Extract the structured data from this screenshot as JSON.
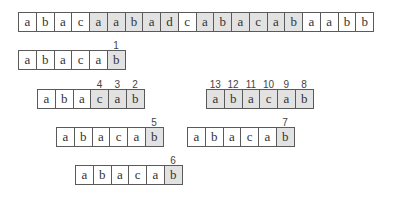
{
  "text": {
    "chars": [
      "a",
      "b",
      "a",
      "c",
      "a",
      "a",
      "b",
      "a",
      "d",
      "c",
      "a",
      "b",
      "a",
      "c",
      "a",
      "b",
      "a",
      "a",
      "b",
      "b"
    ],
    "shaded": [
      false,
      false,
      false,
      false,
      true,
      true,
      true,
      true,
      true,
      false,
      true,
      true,
      true,
      true,
      true,
      true,
      false,
      false,
      false,
      false
    ]
  },
  "pattern_rows": [
    {
      "id": "row1",
      "x": 18,
      "y": 50,
      "chars": [
        "a",
        "b",
        "a",
        "c",
        "a",
        "b"
      ],
      "shaded": [
        false,
        false,
        false,
        false,
        false,
        true
      ],
      "labels": [
        "",
        "",
        "",
        "",
        "",
        "1"
      ]
    },
    {
      "id": "row2-left",
      "x": 37,
      "y": 89,
      "chars": [
        "a",
        "b",
        "a",
        "c",
        "a",
        "b"
      ],
      "shaded": [
        false,
        false,
        false,
        true,
        true,
        true
      ],
      "labels": [
        "",
        "",
        "",
        "4",
        "3",
        "2"
      ]
    },
    {
      "id": "row2-right",
      "x": 206,
      "y": 89,
      "chars": [
        "a",
        "b",
        "a",
        "c",
        "a",
        "b"
      ],
      "shaded": [
        true,
        true,
        true,
        true,
        true,
        true
      ],
      "labels": [
        "13",
        "12",
        "11",
        "10",
        "9",
        "8"
      ]
    },
    {
      "id": "row3-left",
      "x": 56,
      "y": 127,
      "chars": [
        "a",
        "b",
        "a",
        "c",
        "a",
        "b"
      ],
      "shaded": [
        false,
        false,
        false,
        false,
        false,
        true
      ],
      "labels": [
        "",
        "",
        "",
        "",
        "",
        "5"
      ]
    },
    {
      "id": "row3-right",
      "x": 187,
      "y": 127,
      "chars": [
        "a",
        "b",
        "a",
        "c",
        "a",
        "b"
      ],
      "shaded": [
        false,
        false,
        false,
        false,
        false,
        true
      ],
      "labels": [
        "",
        "",
        "",
        "",
        "",
        "7"
      ]
    },
    {
      "id": "row4",
      "x": 75,
      "y": 165,
      "chars": [
        "a",
        "b",
        "a",
        "c",
        "a",
        "b"
      ],
      "shaded": [
        false,
        false,
        false,
        false,
        false,
        true
      ],
      "labels": [
        "",
        "",
        "",
        "",
        "",
        "6"
      ]
    }
  ],
  "colors": {
    "shade": "#e2e2e2",
    "border": "#5a5a5a"
  }
}
